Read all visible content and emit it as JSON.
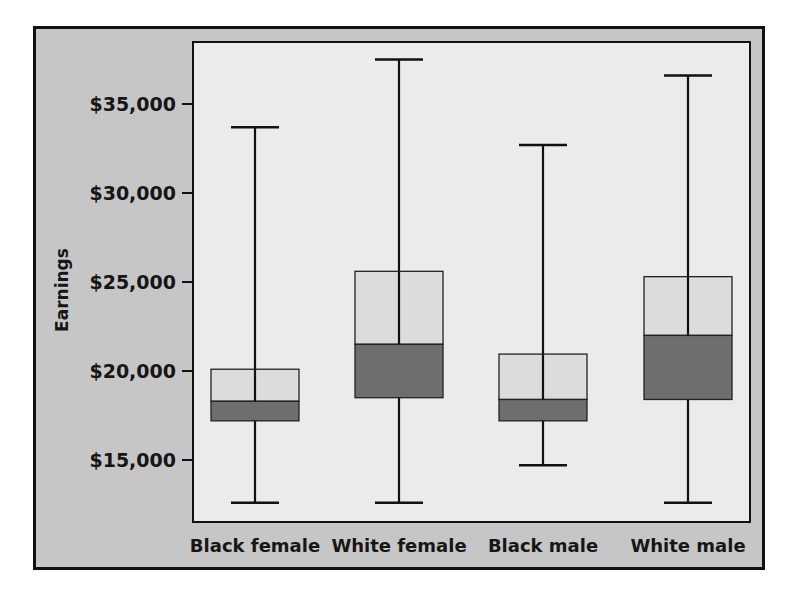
{
  "chart_data": {
    "type": "boxplot",
    "title": "",
    "xlabel": "",
    "ylabel": "Earnings",
    "ylim": [
      11500,
      38500
    ],
    "yticks": [
      15000,
      20000,
      25000,
      30000,
      35000
    ],
    "ytick_labels": [
      "$15,000",
      "$20,000",
      "$25,000",
      "$30,000",
      "$35,000"
    ],
    "categories": [
      "Black female",
      "White female",
      "Black male",
      "White male"
    ],
    "grid": false,
    "legend": null,
    "box_colors": {
      "upper_half": "#dcdcdc",
      "lower_half": "#6e6e6e"
    },
    "series": [
      {
        "name": "Black female",
        "min": 12600,
        "q1": 17200,
        "median": 18300,
        "q3": 20100,
        "max": 33700
      },
      {
        "name": "White female",
        "min": 12600,
        "q1": 18500,
        "median": 21500,
        "q3": 25600,
        "max": 37500
      },
      {
        "name": "Black male",
        "min": 14700,
        "q1": 17200,
        "median": 18400,
        "q3": 20950,
        "max": 32700
      },
      {
        "name": "White male",
        "min": 12600,
        "q1": 18400,
        "median": 22000,
        "q3": 25300,
        "max": 36600
      }
    ]
  },
  "colors": {
    "frame_bg": "#c6c6c6",
    "plot_bg": "#ebebeb",
    "axis": "#111111"
  }
}
